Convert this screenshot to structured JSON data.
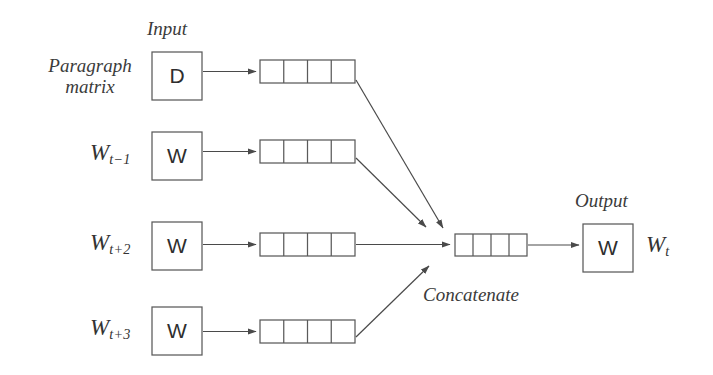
{
  "diagram": {
    "stroke_color": "#5a5a5a",
    "text_color": "#3b3b3b",
    "background": "#ffffff",
    "section_labels": {
      "input": "Input",
      "output": "Output",
      "concatenate": "Concatenate"
    },
    "paragraph_label": {
      "line1": "Paragraph",
      "line2": "matrix"
    },
    "inputs": [
      {
        "id": "paragraph",
        "box_char": "D",
        "label_main": "",
        "label_sub": "",
        "vector_cells": 4
      },
      {
        "id": "word-t-minus-1",
        "box_char": "W",
        "label_main": "W",
        "label_sub": "t−1",
        "vector_cells": 4
      },
      {
        "id": "word-t-plus-2",
        "box_char": "W",
        "label_main": "W",
        "label_sub": "t+2",
        "vector_cells": 4
      },
      {
        "id": "word-t-plus-3",
        "box_char": "W",
        "label_main": "W",
        "label_sub": "t+3",
        "vector_cells": 4
      }
    ],
    "concat_vector": {
      "cells": 4
    },
    "output": {
      "box_char": "W",
      "label_main": "W",
      "label_sub": "t"
    }
  }
}
